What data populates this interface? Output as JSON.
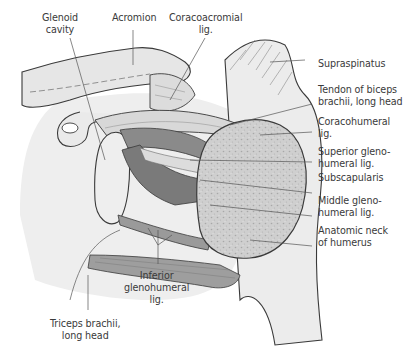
{
  "figure": {
    "colors": {
      "bone_fill": "#e6e6e6",
      "bone_outline": "#3a3a3a",
      "muscle_dark": "#7f7f7f",
      "muscle_mid": "#a9a9a9",
      "humeral_head_cut": "#c9c9c9",
      "leader_line": "#555555",
      "label_text": "#3a3a3a"
    }
  },
  "labels": {
    "glenoid_cavity": {
      "line1": "Glenoid",
      "line2": "cavity"
    },
    "acromion": {
      "line1": "Acromion"
    },
    "coracoacromial_lig": {
      "line1": "Coracoacromial",
      "line2": "lig."
    },
    "supraspinatus": {
      "line1": "Supraspinatus"
    },
    "tendon_biceps": {
      "line1": "Tendon of biceps",
      "line2": "brachii, long head"
    },
    "coracohumeral_lig": {
      "line1": "Coracohumeral",
      "line2": "lig."
    },
    "superior_glenohumeral_lig": {
      "line1": "Superior gleno-",
      "line2": "humeral lig."
    },
    "subscapularis": {
      "line1": "Subscapularis"
    },
    "middle_glenohumeral_lig": {
      "line1": "Middle gleno-",
      "line2": "humeral lig."
    },
    "anatomic_neck": {
      "line1": "Anatomic neck",
      "line2": "of humerus"
    },
    "inferior_glenohumeral_lig": {
      "line1": "Inferior",
      "line2": "glenohumeral",
      "line3": "lig."
    },
    "triceps_long_head": {
      "line1": "Triceps brachii,",
      "line2": "long head"
    }
  }
}
